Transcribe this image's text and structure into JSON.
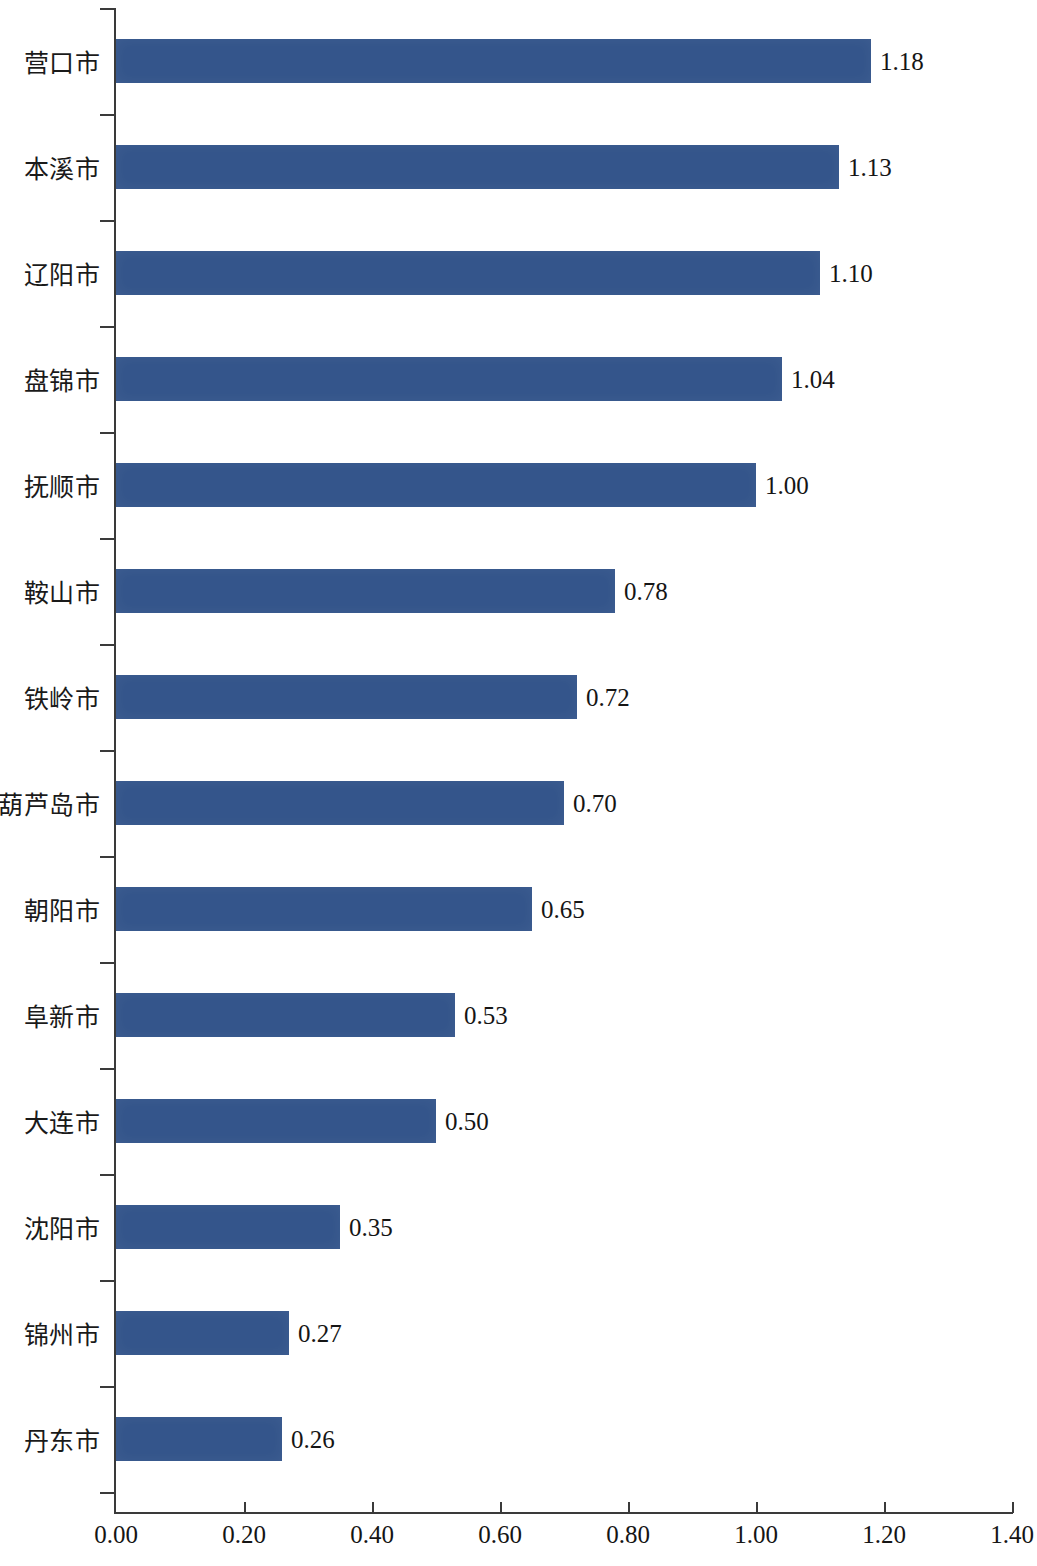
{
  "chart_data": {
    "type": "bar",
    "orientation": "horizontal",
    "title": "",
    "subtitle": "",
    "xlabel": "",
    "ylabel": "",
    "xlim": [
      0.0,
      1.4
    ],
    "xticks": [
      "0.00",
      "0.20",
      "0.40",
      "0.60",
      "0.80",
      "1.00",
      "1.20",
      "1.40"
    ],
    "xtick_values": [
      0.0,
      0.2,
      0.4,
      0.6,
      0.8,
      1.0,
      1.2,
      1.4
    ],
    "grid": false,
    "legend": null,
    "sorted": "descending",
    "bar_color": "#34558b",
    "axis_color": "#3a3a3a",
    "text_color": "#151515",
    "categories": [
      "营口市",
      "本溪市",
      "辽阳市",
      "盘锦市",
      "抚顺市",
      "鞍山市",
      "铁岭市",
      "葫芦岛市",
      "朝阳市",
      "阜新市",
      "大连市",
      "沈阳市",
      "锦州市",
      "丹东市"
    ],
    "values": [
      1.18,
      1.13,
      1.1,
      1.04,
      1.0,
      0.78,
      0.72,
      0.7,
      0.65,
      0.53,
      0.5,
      0.35,
      0.27,
      0.26
    ],
    "value_labels": [
      "1.18",
      "1.13",
      "1.10",
      "1.04",
      "1.00",
      "0.78",
      "0.72",
      "0.70",
      "0.65",
      "0.53",
      "0.50",
      "0.35",
      "0.27",
      "0.26"
    ]
  }
}
